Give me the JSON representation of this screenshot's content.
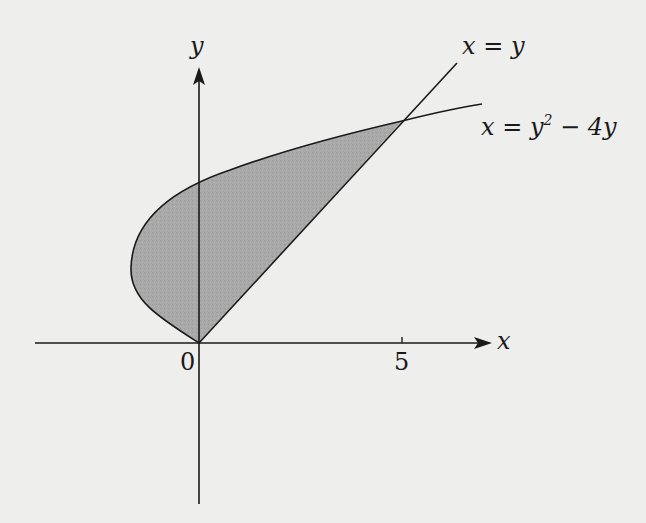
{
  "figure": {
    "background": "#eeeeec",
    "region_fill": "#a9a9a9",
    "stroke_color": "#1a1a1a",
    "axes": {
      "x_label": "x",
      "y_label": "y",
      "origin_label": "0",
      "x_tick_label": "5"
    },
    "curves": [
      {
        "name": "line",
        "label": "x = y"
      },
      {
        "name": "parabola",
        "label_main": "x = y",
        "label_sup": "2",
        "label_tail": " − 4y"
      }
    ],
    "shaded_region": "region bounded by x = y and x = y^2 - 4y between y = 0 and y = 5",
    "intersection_points": [
      [
        0,
        0
      ],
      [
        5,
        5
      ]
    ]
  }
}
